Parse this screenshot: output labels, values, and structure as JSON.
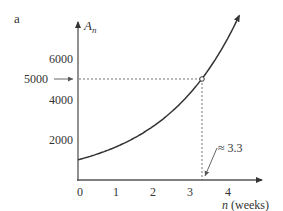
{
  "panel_label": "a",
  "chart_data": {
    "type": "line",
    "title": "",
    "xlabel": "n (weeks)",
    "ylabel": "A_n",
    "ylabel_display": {
      "base": "A",
      "sub": "n"
    },
    "xlabel_display": {
      "var": "n",
      "unit": "(weeks)"
    },
    "x_ticks": [
      0,
      1,
      2,
      3,
      4
    ],
    "y_ticks": [
      2000,
      4000,
      6000
    ],
    "y_marked_value": 5000,
    "xlim": [
      0,
      5
    ],
    "ylim": [
      0,
      7900
    ],
    "grid": false,
    "series": [
      {
        "name": "A_n",
        "model": "A_n = 1000 * 1.63^n",
        "x": [
          0,
          0.5,
          1,
          1.5,
          2,
          2.5,
          3,
          3.3,
          3.5,
          4,
          4.3
        ],
        "values": [
          1000,
          1277,
          1630,
          2081,
          2657,
          3392,
          4330,
          5000,
          5528,
          7057,
          7900
        ]
      }
    ],
    "annotations": [
      {
        "type": "point",
        "x": 3.3,
        "y": 5000
      },
      {
        "type": "hline-dashed",
        "y": 5000,
        "from_x": 0,
        "to_x": 3.3
      },
      {
        "type": "vline-dashed",
        "x": 3.3,
        "from_y": 0,
        "to_y": 5000
      },
      {
        "type": "arrow-label",
        "text": "5000",
        "points_to": {
          "x": 0,
          "y": 5000
        }
      },
      {
        "type": "arrow-label",
        "text": "≈ 3.3",
        "points_to": {
          "x": 3.3,
          "y": 0
        }
      }
    ]
  },
  "labels": {
    "y_tick_6000": "6000",
    "y_tick_5000": "5000",
    "y_tick_4000": "4000",
    "y_tick_2000": "2000",
    "x_tick_0": "0",
    "x_tick_1": "1",
    "x_tick_2": "2",
    "x_tick_3": "3",
    "x_tick_4": "4",
    "approx_label": "≈ 3.3",
    "x_axis_var": "n",
    "x_axis_unit": "(weeks)",
    "y_axis_base": "A",
    "y_axis_sub": "n"
  },
  "colors": {
    "axis": "#555555",
    "curve": "#333333",
    "dashed": "#777777",
    "text": "#333333"
  }
}
